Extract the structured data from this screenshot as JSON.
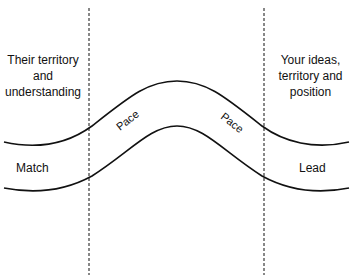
{
  "diagram": {
    "zones": {
      "left": [
        "Their territory",
        "and",
        "understanding"
      ],
      "right": [
        "Your ideas,",
        "territory and",
        "position"
      ]
    },
    "path_labels": {
      "start": "Match",
      "end": "Lead",
      "pace_left": "Pace",
      "pace_right": "Pace"
    },
    "colors": {
      "line": "#111111",
      "background": "#ffffff"
    }
  }
}
